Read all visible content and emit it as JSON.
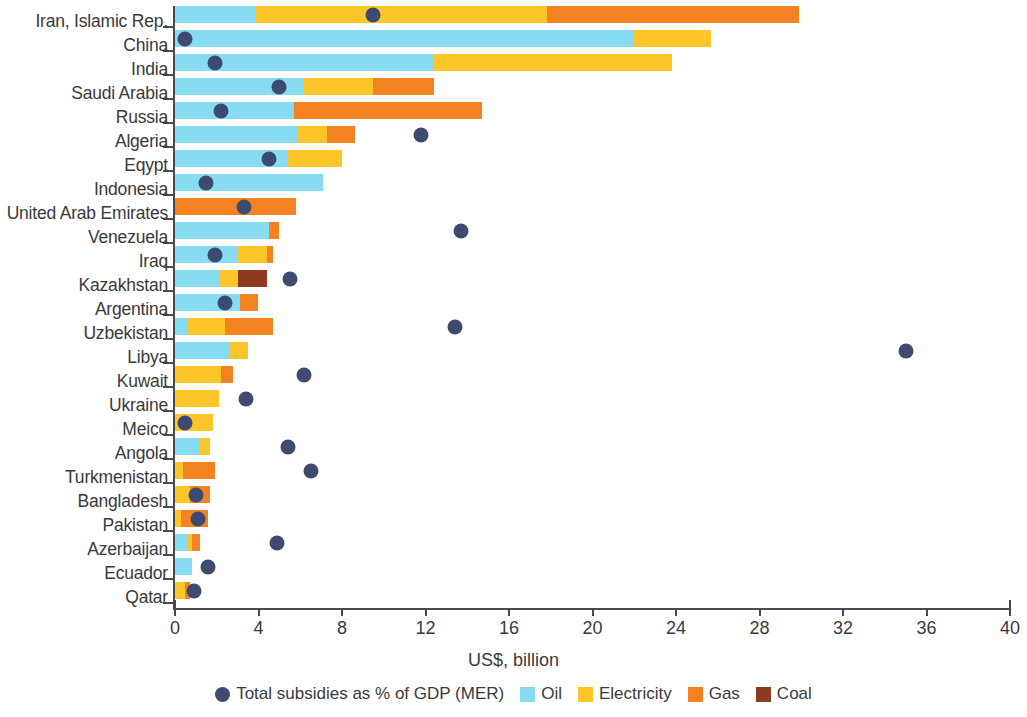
{
  "chart_data": {
    "type": "bar",
    "orientation": "horizontal",
    "stacked": true,
    "title": "",
    "xlabel": "US$, billion",
    "ylabel": "",
    "xlim": [
      0,
      40
    ],
    "xticks": [
      0,
      4,
      8,
      12,
      16,
      20,
      24,
      28,
      32,
      36,
      40
    ],
    "grid": false,
    "legend_position": "bottom",
    "categories": [
      "Iran, Islamic Rep.",
      "China",
      "India",
      "Saudi Arabia",
      "Russia",
      "Algeria",
      "Eqypt",
      "Indonesia",
      "United Arab Emirates",
      "Venezuela",
      "Iraq",
      "Kazakhstan",
      "Argentina",
      "Uzbekistan",
      "Libya",
      "Kuwait",
      "Ukraine",
      "Meico",
      "Angola",
      "Turkmenistan",
      "Bangladesh",
      "Pakistan",
      "Azerbaijan",
      "Ecuador",
      "Qatar"
    ],
    "series": [
      {
        "name": "Oil",
        "color": "#87dcf2",
        "values": [
          3.9,
          22.0,
          12.4,
          6.2,
          5.7,
          5.9,
          5.4,
          7.1,
          0.0,
          4.5,
          3.0,
          2.1,
          3.1,
          0.6,
          2.6,
          0.0,
          0.0,
          0.0,
          1.2,
          0.0,
          0.0,
          0.0,
          0.6,
          0.8,
          0.0
        ]
      },
      {
        "name": "Electricity",
        "color": "#fcc62b",
        "values": [
          13.9,
          3.7,
          11.4,
          3.3,
          0.0,
          1.4,
          2.6,
          0.0,
          0.0,
          0.0,
          1.4,
          0.9,
          0.0,
          1.8,
          0.9,
          2.2,
          2.1,
          1.8,
          0.5,
          0.4,
          0.7,
          0.3,
          0.2,
          0.0,
          0.5
        ]
      },
      {
        "name": "Gas",
        "color": "#f58220",
        "values": [
          12.1,
          0.0,
          0.0,
          2.9,
          9.0,
          1.3,
          0.0,
          0.0,
          5.8,
          0.5,
          0.3,
          0.0,
          0.9,
          2.3,
          0.0,
          0.6,
          0.0,
          0.0,
          0.0,
          1.5,
          1.0,
          1.3,
          0.4,
          0.0,
          0.2
        ]
      },
      {
        "name": "Coal",
        "color": "#8c3b1e",
        "values": [
          0.0,
          0.0,
          0.0,
          0.0,
          0.0,
          0.0,
          0.0,
          0.0,
          0.0,
          0.0,
          0.0,
          1.4,
          0.0,
          0.0,
          0.0,
          0.0,
          0.0,
          0.0,
          0.0,
          0.0,
          0.0,
          0.0,
          0.0,
          0.0,
          0.0
        ]
      }
    ],
    "overlay_series": {
      "name": "Total subsidies as % of GDP (MER)",
      "color": "#3d4a72",
      "marker": "circle",
      "values": [
        9.5,
        0.5,
        1.9,
        5.0,
        2.2,
        11.8,
        4.5,
        1.5,
        3.3,
        13.7,
        1.9,
        5.5,
        2.4,
        13.4,
        35.0,
        6.2,
        3.4,
        0.5,
        5.4,
        6.5,
        1.0,
        1.1,
        4.9,
        1.6,
        0.9
      ]
    },
    "legend_entries": [
      {
        "label": "Total subsidies as % of GDP (MER)",
        "color": "#3d4a72",
        "shape": "circle"
      },
      {
        "label": "Oil",
        "color": "#87dcf2",
        "shape": "square"
      },
      {
        "label": "Electricity",
        "color": "#fcc62b",
        "shape": "square"
      },
      {
        "label": "Gas",
        "color": "#f58220",
        "shape": "square"
      },
      {
        "label": "Coal",
        "color": "#8c3b1e",
        "shape": "square"
      }
    ]
  }
}
